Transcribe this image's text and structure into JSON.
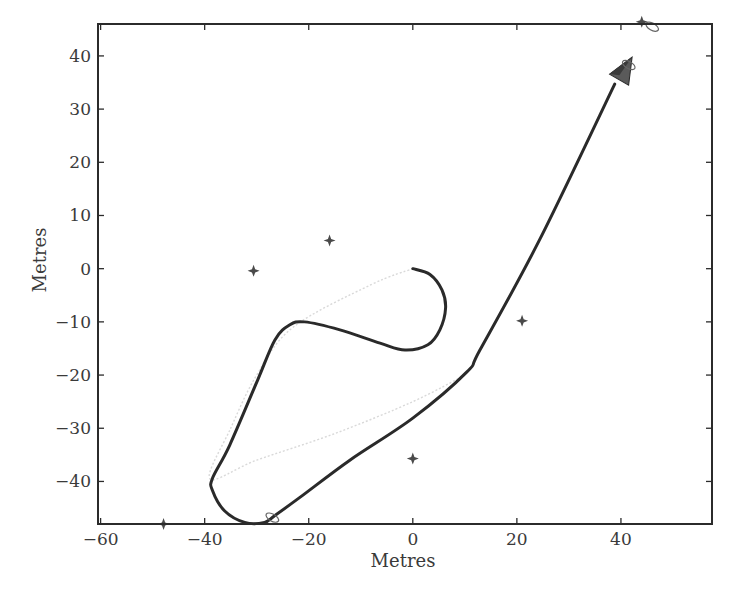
{
  "chart_data": {
    "type": "line",
    "title": "",
    "xlabel": "Metres",
    "ylabel": "Metres",
    "xlim": [
      -60.5,
      57.5
    ],
    "ylim": [
      -48,
      46
    ],
    "grid": false,
    "legend": null,
    "x_ticks": [
      -60,
      -40,
      -20,
      0,
      20,
      40
    ],
    "x_tick_labels": [
      "−60",
      "−40",
      "−20",
      "0",
      "20",
      "40"
    ],
    "y_ticks": [
      40,
      30,
      20,
      10,
      0,
      -10,
      -20,
      -30,
      -40
    ],
    "y_tick_labels": [
      "40",
      "30",
      "20",
      "10",
      "0",
      "−10",
      "−20",
      "−30",
      "−40"
    ],
    "series": [
      {
        "name": "vehicle-trajectory",
        "style": "solid-dark",
        "color": "#2a2a2a",
        "x": [
          0,
          3.3,
          5.6,
          6.3,
          5.2,
          2.9,
          -1.5,
          -6.3,
          -14,
          -20.8,
          -23.7,
          -26.5,
          -29.8,
          -35.2,
          -38.5,
          -38.5,
          -36.2,
          -32.3,
          -28.5,
          -26.5,
          -21.7,
          -12.1,
          0,
          10.4,
          12.9,
          24.4,
          38.8
        ],
        "y": [
          0,
          -1.1,
          -4,
          -7.4,
          -11.5,
          -14.3,
          -15.3,
          -14,
          -11.5,
          -10,
          -10.6,
          -13.4,
          -20.9,
          -33.2,
          -39.4,
          -41.7,
          -45.5,
          -47.7,
          -47.7,
          -46.4,
          -43,
          -36,
          -28.1,
          -19.4,
          -15.3,
          5.5,
          34.7
        ]
      },
      {
        "name": "estimated-path",
        "style": "faint-dotted",
        "color": "#d9d9d9",
        "x": [
          0,
          -8,
          -23,
          -30,
          -35,
          -39,
          -30,
          -15,
          0,
          10
        ],
        "y": [
          0,
          -3,
          -11,
          -20,
          -30,
          -39.5,
          -36,
          -31,
          -25,
          -20
        ]
      },
      {
        "name": "landmarks",
        "style": "star-marker",
        "color": "#4a4a4a",
        "x": [
          -30.6,
          -16,
          21,
          0,
          -47.9,
          44
        ],
        "y": [
          -0.4,
          5.3,
          -9.8,
          -35.7,
          -48,
          46.4
        ]
      }
    ],
    "annotations": [
      {
        "type": "vehicle-pose-arrow",
        "x": 40.8,
        "y": 37.5,
        "heading_deg": 60,
        "color": "#5a5a5a"
      },
      {
        "type": "uncertainty-ellipse",
        "x": 41.5,
        "y": 38.3
      },
      {
        "type": "uncertainty-ellipse",
        "x": 46,
        "y": 45.5
      },
      {
        "type": "uncertainty-ellipse",
        "x": -27,
        "y": -46.8
      }
    ]
  }
}
